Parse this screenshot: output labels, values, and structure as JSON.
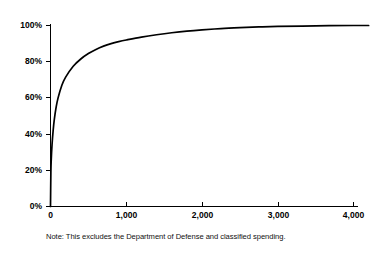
{
  "figure": {
    "title_remnant": "",
    "note": "Note:  This excludes the Department of Defense and classified spending.",
    "line_color": "#000000",
    "background_color": "#ffffff"
  },
  "axes": {
    "y_ticks": [
      "0%",
      "20%",
      "40%",
      "60%",
      "80%",
      "100%"
    ],
    "x_ticks": [
      "0",
      "1,000",
      "2,000",
      "3,000",
      "4,000"
    ]
  },
  "chart_data": {
    "type": "line",
    "title": "",
    "subtitle": "",
    "xlabel": "",
    "ylabel": "",
    "xlim": [
      0,
      4200
    ],
    "ylim": [
      0,
      100
    ],
    "grid": false,
    "legend": false,
    "annotations": [
      "Note:  This excludes the Department of Defense and classified spending."
    ],
    "xtick_values": [
      0,
      1000,
      2000,
      3000,
      4000
    ],
    "xtick_labels": [
      "0",
      "1,000",
      "2,000",
      "3,000",
      "4,000"
    ],
    "ytick_values": [
      0,
      20,
      40,
      60,
      80,
      100
    ],
    "ytick_labels": [
      "0%",
      "20%",
      "40%",
      "60%",
      "80%",
      "100%"
    ],
    "series": [
      {
        "name": "Cumulative share of spending",
        "x": [
          0,
          5,
          10,
          20,
          35,
          50,
          75,
          100,
          150,
          200,
          300,
          400,
          500,
          600,
          700,
          800,
          900,
          1000,
          1200,
          1400,
          1600,
          1800,
          2000,
          2250,
          2500,
          2750,
          3000,
          3500,
          4000,
          4200
        ],
        "values": [
          0,
          19,
          26,
          34,
          42,
          48,
          55,
          60,
          67,
          71.5,
          77.5,
          81.5,
          84.5,
          86.8,
          88.6,
          90.0,
          91.1,
          92.0,
          93.6,
          94.9,
          96.0,
          96.9,
          97.6,
          98.3,
          98.8,
          99.2,
          99.5,
          99.8,
          100,
          100
        ]
      }
    ]
  }
}
